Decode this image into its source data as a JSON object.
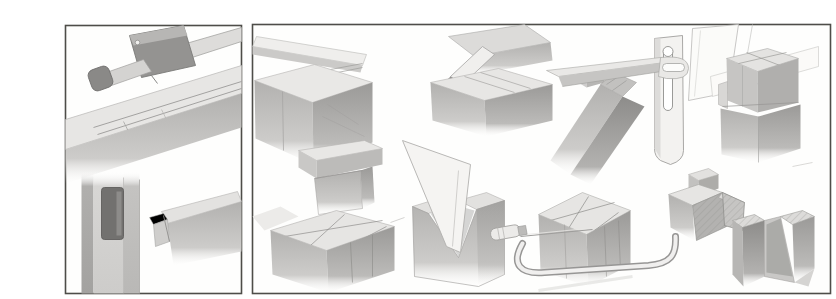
{
  "canvas": {
    "width": 802,
    "height": 287,
    "background_color": "#ffffff"
  },
  "palette": {
    "paper": "#fefefd",
    "panel_border": "#4e4d49",
    "pencil_light": "#e7e6e4",
    "pencil_mid": "#bcbbb9",
    "pencil_dark": "#959492",
    "pencil_deep": "#737270",
    "mortise_hole": "#72716f"
  },
  "illustration": {
    "description": "Pencil illustration plate of woodworking joints and tools in two bordered panels",
    "left_panel_label": "marking-out and mortise-and-tenon vignettes",
    "right_panel_label": "joint cutting and fitting vignettes"
  },
  "panels": [
    {
      "name": "left-panel",
      "vignettes": [
        {
          "name": "mortise-gauge-marking-beam"
        },
        {
          "name": "mortise-and-tenon-joint"
        }
      ]
    },
    {
      "name": "right-panel",
      "vignettes": [
        {
          "name": "rebate-joint-with-board"
        },
        {
          "name": "stub-tenon-block"
        },
        {
          "name": "block-with-marked-dovetail-lines"
        },
        {
          "name": "keyed-mitre-corner-joint"
        },
        {
          "name": "backsaw-cutting-notched-block"
        },
        {
          "name": "latch-arm-and-slotted-plate"
        },
        {
          "name": "coping-saw-around-marked-block"
        },
        {
          "name": "stacked-cube-blocks"
        },
        {
          "name": "dovetail-pin-and-socket"
        }
      ]
    }
  ]
}
